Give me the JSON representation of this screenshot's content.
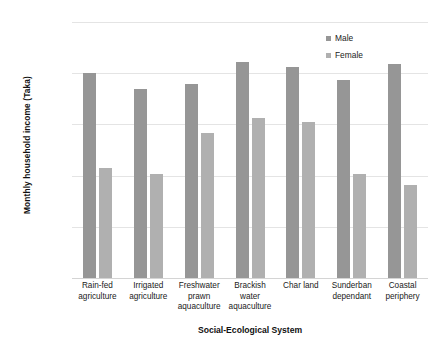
{
  "chart_data": {
    "type": "bar",
    "title": "",
    "xlabel": "Social-Ecological System",
    "ylabel": "Monthly household income (Taka)",
    "ylim": [
      0,
      10000
    ],
    "ytick_labels": [
      "10,000",
      "8,000",
      "6,000",
      "4,000",
      "2,000",
      "0"
    ],
    "yticks": [
      10000,
      8000,
      6000,
      4000,
      2000,
      0
    ],
    "grid": true,
    "legend_position": "top-right",
    "categories": [
      "Rain-fed agriculture",
      "Irrigated agriculture",
      "Freshwater prawn aquaculture",
      "Brackish water aquaculture",
      "Char land",
      "Sunderban dependant",
      "Coastal periphery"
    ],
    "series": [
      {
        "name": "Male",
        "color": "#969696",
        "values": [
          8000,
          7400,
          7560,
          8450,
          8250,
          7720,
          8350
        ]
      },
      {
        "name": "Female",
        "color": "#b0b0b0",
        "values": [
          4280,
          4050,
          5650,
          6250,
          6080,
          4080,
          3650
        ]
      }
    ]
  }
}
